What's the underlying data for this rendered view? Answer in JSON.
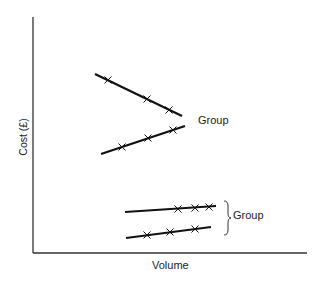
{
  "diagram": {
    "axes": {
      "y_label": "Cost (£)",
      "x_label": "Volume"
    },
    "groups": [
      {
        "label": "Group",
        "lines": [
          {
            "id": "line-1",
            "x1": 95,
            "y1": 74,
            "x2": 182,
            "y2": 116,
            "markers": [
              [
                108,
                80
              ],
              [
                147,
                99
              ],
              [
                169,
                110
              ]
            ]
          },
          {
            "id": "line-2",
            "x1": 101,
            "y1": 154,
            "x2": 185,
            "y2": 126,
            "markers": [
              [
                122,
                147
              ],
              [
                148,
                138
              ],
              [
                173,
                130
              ]
            ]
          }
        ]
      },
      {
        "label": "Group",
        "bracket": "}",
        "lines": [
          {
            "id": "line-3",
            "x1": 125,
            "y1": 212,
            "x2": 216,
            "y2": 206,
            "markers": [
              [
                178,
                209
              ],
              [
                195,
                208
              ],
              [
                209,
                207
              ]
            ]
          },
          {
            "id": "line-4",
            "x1": 126,
            "y1": 238,
            "x2": 211,
            "y2": 227,
            "markers": [
              [
                147,
                235
              ],
              [
                170,
                232
              ],
              [
                195,
                229
              ]
            ]
          }
        ]
      }
    ],
    "colors": {
      "line": "#111111",
      "axis": "#333333",
      "background": "#ffffff"
    }
  }
}
